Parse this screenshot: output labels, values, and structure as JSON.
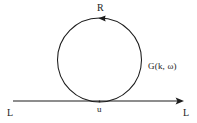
{
  "figure": {
    "type": "feynman-diagram",
    "background_color": "#ffffff",
    "stroke_color": "#1c1c1c",
    "text_color": "#1c1c1c",
    "width": 197,
    "height": 123
  },
  "labels": {
    "loop_momentum": "R",
    "propagator": "G(k, ω)",
    "vertex": "u",
    "line_left": "L",
    "line_right": "L"
  },
  "geometry": {
    "loop": {
      "center_x": 99.5,
      "center_y": 60,
      "radius": 42
    },
    "base_line": {
      "x_start": 13,
      "x_end": 184,
      "y": 101
    },
    "loop_arrow": {
      "x": 101,
      "y": 18.5,
      "direction": "left"
    },
    "line_arrow": {
      "x": 184,
      "y": 101,
      "direction": "right"
    }
  }
}
